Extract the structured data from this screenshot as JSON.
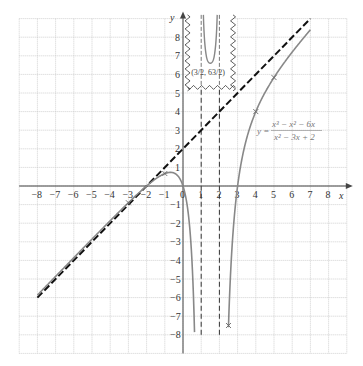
{
  "chart_data": {
    "type": "line",
    "title": "",
    "xlabel": "x",
    "ylabel": "y",
    "xlim": [
      -8,
      8
    ],
    "ylim": [
      -8,
      8
    ],
    "grid": true,
    "x_ticks": [
      "-8",
      "-7",
      "-6",
      "-5",
      "-4",
      "-3",
      "-2",
      "-1",
      "0",
      "1",
      "2",
      "3",
      "4",
      "5",
      "6",
      "7",
      "8"
    ],
    "y_ticks": [
      "8",
      "7",
      "6",
      "5",
      "4",
      "3",
      "2",
      "1",
      "-1",
      "-2",
      "-3",
      "-4",
      "-5",
      "-6",
      "-7",
      "-8"
    ],
    "series": [
      {
        "name": "y = (x^3 - x^2 - 6x)/(x^2 - 3x + 2)",
        "style": "solid gray curve",
        "color": "#888888",
        "branches": [
          {
            "x": [
              -8,
              -6,
              -4,
              -3,
              -2,
              -1,
              -0.5,
              0,
              0.3,
              0.5,
              0.65,
              0.72
            ],
            "y": [
              -5.87,
              -3.89,
              -1.93,
              -0.9,
              0,
              0.67,
              0.42,
              0,
              -1.32,
              -4.17,
              -9.2,
              -8.0
            ]
          },
          {
            "x": [
              2.25,
              2.5,
              2.75,
              3,
              3.5,
              4,
              5,
              6,
              7
            ],
            "y": [
              -8.0,
              -7.5,
              -2.88,
              0,
              2.43,
              4,
              5.83,
              7.2,
              8.4
            ]
          }
        ],
        "marked_points": [
          {
            "x": -3,
            "y": -0.9
          },
          {
            "x": -1,
            "y": 0.67
          },
          {
            "x": 2.5,
            "y": -7.5
          },
          {
            "x": 4,
            "y": 4
          },
          {
            "x": 5,
            "y": 5.83
          }
        ]
      },
      {
        "name": "oblique asymptote y = x + 2",
        "style": "black dashed",
        "color": "#111111",
        "x": [
          -8,
          7
        ],
        "y": [
          -6,
          9
        ]
      },
      {
        "name": "vertical asymptote x = 1",
        "style": "dashed",
        "color": "#333333",
        "x": [
          1,
          1
        ],
        "y": [
          -8,
          5.3
        ]
      },
      {
        "name": "vertical asymptote x = 2",
        "style": "dashed",
        "color": "#333333",
        "x": [
          2,
          2
        ],
        "y": [
          -8,
          5.3
        ]
      }
    ],
    "annotations": {
      "equation_numerator": "x³ − x² − 6x",
      "equation_denominator": "x² − 3x + 2",
      "equation_prefix": "y =",
      "inset_point_label": "(3/2, 63/2)",
      "inset_point_x_num": "3",
      "inset_point_x_den": "2",
      "inset_point_y_num": "63",
      "inset_point_y_den": "2",
      "inset_description": "broken-axis inset showing local minimum of middle branch"
    }
  },
  "labels": {
    "x_axis": "x",
    "y_axis": "y",
    "origin": "0"
  }
}
